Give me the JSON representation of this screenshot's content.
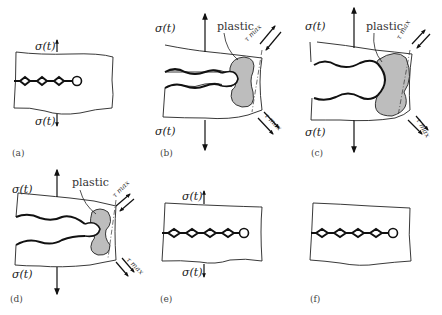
{
  "figure": {
    "panels": [
      {
        "id": "a",
        "caption": "(a)",
        "stress_top": "σ(t)",
        "stress_bottom": "σ(t)",
        "state": "closed crack, small arrows"
      },
      {
        "id": "b",
        "caption": "(b)",
        "stress_top": "σ(t)",
        "stress_bottom": "σ(t)",
        "plastic_label": "plastic",
        "tau_top": "τ max",
        "tau_bottom": "τ max",
        "state": "opened crack with plastic zone"
      },
      {
        "id": "c",
        "caption": "(c)",
        "stress_top": "σ(t)",
        "stress_bottom": "σ(t)",
        "plastic_label": "plastic",
        "tau_top": "τ max",
        "tau_bottom": "τ max",
        "state": "max opening, blunted tip"
      },
      {
        "id": "d",
        "caption": "(d)",
        "stress_top": "σ(t)",
        "stress_bottom": "σ(t)",
        "plastic_label": "plastic",
        "tau_top": "τ max",
        "tau_bottom": "τ max",
        "state": "unloading"
      },
      {
        "id": "e",
        "caption": "(e)",
        "stress_top": "σ(t)",
        "stress_bottom": "σ(t)",
        "state": "closed crack, extended"
      },
      {
        "id": "f",
        "caption": "(f)",
        "state": "unloaded crack"
      }
    ]
  }
}
